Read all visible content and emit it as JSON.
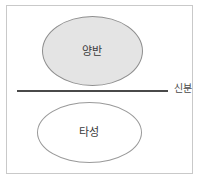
{
  "diagram": {
    "title": "",
    "colors": {
      "frame_border": "#c9c9c9",
      "upper_ellipse_fill": "#e4e4e4",
      "upper_ellipse_stroke": "#8e8e8e",
      "lower_ellipse_fill": "#ffffff",
      "lower_ellipse_stroke": "#9a9a9a",
      "divider_line": "#4a4a4a",
      "text": "#3a3a3a",
      "background": "#ffffff"
    },
    "shapes": {
      "upper_ellipse": {
        "label": "양반",
        "shape_name": "ellipse",
        "filled": "true"
      },
      "lower_ellipse": {
        "label": "타성",
        "shape_name": "ellipse",
        "filled": "false"
      },
      "divider": {
        "label": "신분",
        "shape_name": "horizontal-line"
      }
    }
  }
}
